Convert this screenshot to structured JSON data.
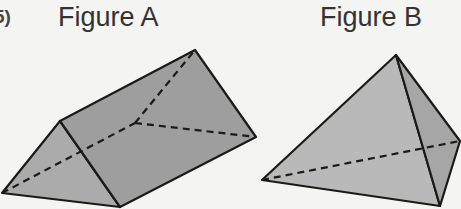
{
  "problem_number": "5)",
  "figures": [
    {
      "label": "Figure A",
      "shape": "triangular-prism"
    },
    {
      "label": "Figure B",
      "shape": "triangular-pyramid"
    }
  ],
  "colors": {
    "background": "#f4f4f2",
    "face_dark": "#9c9c9c",
    "face_mid": "#a9a9a9",
    "face_light": "#b8b8b8",
    "edge": "#1a1a1a"
  }
}
